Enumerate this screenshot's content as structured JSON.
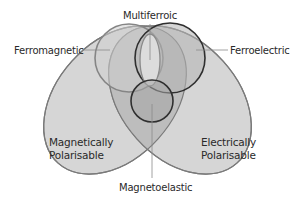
{
  "diagram": {
    "type": "venn",
    "labels": {
      "multiferroic": "Multiferroic",
      "ferromagnetic": "Ferromagnetic",
      "ferroelectric": "Ferroelectric",
      "magnetically_polarisable_line1": "Magnetically",
      "magnetically_polarisable_line2": "Polarisable",
      "electrically_polarisable_line1": "Electrically",
      "electrically_polarisable_line2": "Polarisable",
      "magnetoelastic": "Magnetoelastic"
    },
    "sets": [
      {
        "id": "magnetically-polarisable",
        "contains": [
          "ferromagnetic"
        ]
      },
      {
        "id": "electrically-polarisable",
        "contains": [
          "ferroelectric"
        ]
      },
      {
        "id": "ferromagnetic"
      },
      {
        "id": "ferroelectric"
      },
      {
        "id": "magnetoelastic"
      },
      {
        "id": "multiferroic",
        "relation": "intersection of ferromagnetic and ferroelectric"
      }
    ],
    "colors": {
      "background": "#ffffff",
      "big_ellipse_fill": "#d6d6d6",
      "overlap_fill": "#b8b8b8",
      "center_fill": "#a8a8a8",
      "ellipse_stroke": "#7a7a7a",
      "ferromagnetic_stroke": "#808080",
      "ferroelectric_stroke": "#2b2b2b",
      "magnetoelastic_stroke": "#2b2b2b",
      "text": "#2a2a2a"
    }
  }
}
